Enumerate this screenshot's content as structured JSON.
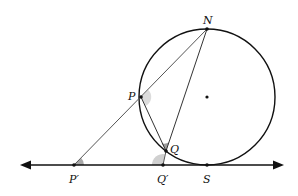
{
  "diagram": {
    "type": "geometry",
    "circle": {
      "cx": 207,
      "cy": 97,
      "r": 68,
      "center_marked": true
    },
    "line": {
      "x1": 20,
      "x2": 284,
      "y": 165,
      "arrows": "both"
    },
    "points": [
      {
        "id": "N",
        "label": "N",
        "x": 207,
        "y": 29,
        "label_x": 203,
        "label_y": 24
      },
      {
        "id": "P",
        "label": "P",
        "x": 141,
        "y": 97,
        "label_x": 128,
        "label_y": 100
      },
      {
        "id": "Q",
        "label": "Q",
        "x": 166,
        "y": 151,
        "label_x": 170,
        "label_y": 153
      },
      {
        "id": "P_prime",
        "label": "P′",
        "x": 74,
        "y": 165,
        "label_x": 69,
        "label_y": 183
      },
      {
        "id": "Q_prime",
        "label": "Q′",
        "x": 163,
        "y": 165,
        "label_x": 157,
        "label_y": 183
      },
      {
        "id": "S",
        "label": "S",
        "x": 207,
        "y": 165,
        "label_x": 203,
        "label_y": 183
      }
    ],
    "segments": [
      {
        "from": "P_prime",
        "to": "N"
      },
      {
        "from": "N",
        "to": "Q"
      },
      {
        "from": "P",
        "to": "Q"
      },
      {
        "from": "Q_prime",
        "to": "Q"
      }
    ],
    "angle_marks": [
      {
        "at": "P",
        "between": [
          "N",
          "Q"
        ],
        "shade": "#dcdcdc"
      },
      {
        "at": "Q",
        "between": [
          "N",
          "P"
        ],
        "shade": "#9a9a9a"
      },
      {
        "at": "P_prime",
        "between": [
          "Q_prime",
          "N"
        ],
        "shade": "#a8a8a8"
      },
      {
        "at": "Q_prime",
        "between": [
          "P_prime",
          "Q"
        ],
        "shade": "#d0d0d0"
      }
    ],
    "colors": {
      "stroke": "#111111",
      "secant": "#555555"
    }
  }
}
